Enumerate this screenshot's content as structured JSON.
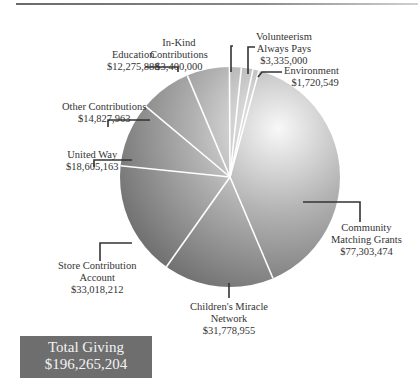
{
  "chart_data": {
    "type": "pie",
    "title": "",
    "categories": [
      "Community Matching Grants",
      "Children's Miracle Network",
      "Store Contribution Account",
      "United Way",
      "Other Contributions",
      "Education",
      "In-Kind Contributions",
      "Volunteerism Always Pays",
      "Environment"
    ],
    "values": [
      77303474,
      31778955,
      33018212,
      18605163,
      14827963,
      12275888,
      3400000,
      3335000,
      1720549
    ],
    "value_labels": [
      "$77,303,474",
      "$31,778,955",
      "$33,018,212",
      "$18,605,163",
      "$14,827,963",
      "$12,275,888",
      "$3,400,000",
      "$3,335,000",
      "$1,720,549"
    ],
    "total": 196265204,
    "total_label": "$196,265,204",
    "legend": "none (callout labels)"
  },
  "labels": {
    "community": {
      "l1": "Community",
      "l2": "Matching Grants",
      "v": "$77,303,474"
    },
    "cmn": {
      "l1": "Children's Miracle",
      "l2": "Network",
      "v": "$31,778,955"
    },
    "store": {
      "l1": "Store Contribution",
      "l2": "Account",
      "v": "$33,018,212"
    },
    "united": {
      "l1": "United Way",
      "v": "$18,605,163"
    },
    "other": {
      "l1": "Other Contributions",
      "v": "$14,827,963"
    },
    "education": {
      "l1": "Education",
      "v": "$12,275,888"
    },
    "inkind": {
      "l1": "In-Kind",
      "l2": "Contributions",
      "v": "$3,400,000"
    },
    "volunteer": {
      "l1": "Volunteerism",
      "l2": "Always Pays",
      "v": "$3,335,000"
    },
    "environment": {
      "l1": "Environment",
      "v": "$1,720,549"
    }
  },
  "total_box": {
    "title": "Total Giving",
    "amount": "$196,265,204"
  },
  "colors": {
    "pie_light": "#f4f4f4",
    "pie_dark": "#7a7a7a",
    "divider": "#ffffff",
    "total_bg": "#6e6e6e"
  }
}
